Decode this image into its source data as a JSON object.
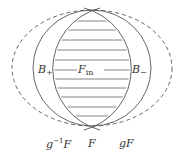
{
  "diagram": {
    "labels": {
      "b_plus": {
        "main": "B",
        "sub": "+"
      },
      "b_minus": {
        "main": "B",
        "sub": "−"
      },
      "f_in": {
        "main": "F",
        "sub": "in"
      },
      "g_inv_f": {
        "pre": "g",
        "sup": "−1",
        "post": "F"
      },
      "f": "F",
      "g_f": "gF"
    },
    "colors": {
      "stroke": "#555555",
      "hatch": "#666666",
      "text": "#333333"
    },
    "shapes": [
      {
        "name": "F",
        "type": "circle",
        "style": "solid"
      },
      {
        "name": "gF / g^-1F outer",
        "type": "ellipse",
        "style": "dashed"
      },
      {
        "name": "F_in",
        "type": "lens",
        "style": "hatched"
      }
    ]
  }
}
